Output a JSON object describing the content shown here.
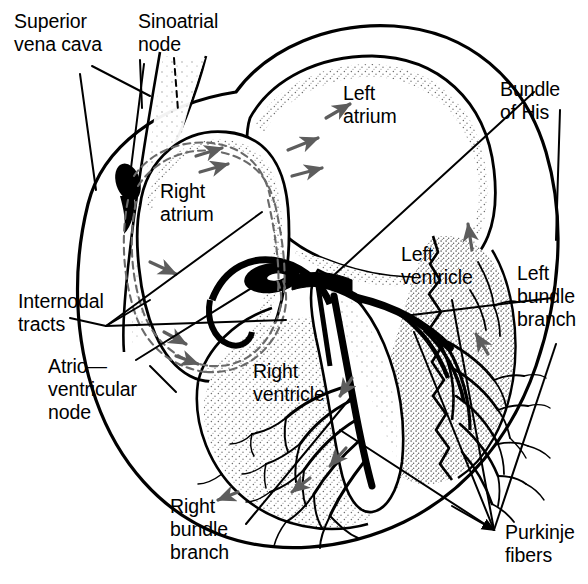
{
  "figure": {
    "style": "black-and-white anatomical line drawing with stippled shading",
    "background_color": "#ffffff",
    "ink_color": "#000000",
    "stipple_color": "#7a7a7a",
    "width": 588,
    "height": 584
  },
  "labels": [
    {
      "id": "superior-vena-cava",
      "text": "Superior\nvena cava",
      "align": "left",
      "x": 14,
      "y": 10,
      "leader": "line"
    },
    {
      "id": "sinoatrial-node",
      "text": "Sinoatrial\nnode",
      "align": "left",
      "x": 138,
      "y": 10,
      "leader": "dashed-line"
    },
    {
      "id": "left-atrium",
      "text": "Left\natrium",
      "align": "left",
      "x": 343,
      "y": 82,
      "leader": "none"
    },
    {
      "id": "bundle-of-his",
      "text": "Bundle\nof His",
      "align": "left",
      "x": 500,
      "y": 78,
      "leader": "line"
    },
    {
      "id": "right-atrium",
      "text": "Right\natrium",
      "align": "left",
      "x": 160,
      "y": 180,
      "leader": "none"
    },
    {
      "id": "left-ventricle",
      "text": "Left\nventricle",
      "align": "left",
      "x": 401,
      "y": 243,
      "leader": "none"
    },
    {
      "id": "left-bundle-branch",
      "text": "Left\nbundle\nbranch",
      "align": "left",
      "x": 517,
      "y": 262,
      "leader": "line"
    },
    {
      "id": "internodal-tracts",
      "text": "Internodal\ntracts",
      "align": "left",
      "x": 18,
      "y": 290,
      "leader": "multi-line"
    },
    {
      "id": "atrioventricular-node",
      "text": "Atrio—\nventricular\nnode",
      "align": "left",
      "x": 48,
      "y": 355,
      "leader": "line"
    },
    {
      "id": "right-ventricle",
      "text": "Right\nventricle",
      "align": "left",
      "x": 253,
      "y": 360,
      "leader": "none"
    },
    {
      "id": "right-bundle-branch",
      "text": "Right\nbundle\nbranch",
      "align": "left",
      "x": 170,
      "y": 495,
      "leader": "line"
    },
    {
      "id": "purkinje-fibers",
      "text": "Purkinje\nfibers",
      "align": "left",
      "x": 505,
      "y": 521,
      "leader": "multi-line"
    }
  ],
  "structures": [
    {
      "id": "heart-outline",
      "name": "Heart outline (whole organ silhouette)"
    },
    {
      "id": "superior-vena-cava",
      "name": "Superior vena cava"
    },
    {
      "id": "right-atrium-chamber",
      "name": "Right atrium chamber"
    },
    {
      "id": "left-atrium-chamber",
      "name": "Left atrium chamber"
    },
    {
      "id": "right-ventricle-chamber",
      "name": "Right ventricle chamber"
    },
    {
      "id": "left-ventricle-chamber",
      "name": "Left ventricle chamber"
    },
    {
      "id": "sa-node",
      "name": "Sinoatrial node"
    },
    {
      "id": "av-node",
      "name": "Atrioventricular node"
    },
    {
      "id": "internodal-tracts",
      "name": "Internodal tracts"
    },
    {
      "id": "bundle-of-his",
      "name": "Bundle of His"
    },
    {
      "id": "left-bundle-branch",
      "name": "Left bundle branch"
    },
    {
      "id": "right-bundle-branch",
      "name": "Right bundle branch"
    },
    {
      "id": "purkinje-fibers",
      "name": "Purkinje fibers"
    },
    {
      "id": "conduction-arrows",
      "name": "Conduction direction arrows"
    }
  ]
}
